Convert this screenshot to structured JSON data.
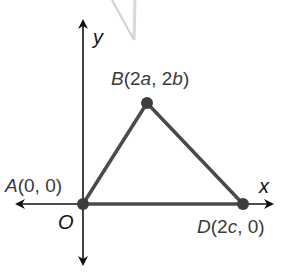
{
  "figure": {
    "type": "coordinate-plane-triangle",
    "axes": {
      "x_label": "x",
      "y_label": "y",
      "origin_label": "O"
    },
    "points": [
      {
        "id": "A",
        "name": "A",
        "coords": "(0, 0)",
        "x_expr": "0",
        "y_expr": "0"
      },
      {
        "id": "B",
        "name": "B",
        "coords": "(2a, 2b)",
        "x_expr": "2a",
        "y_expr": "2b"
      },
      {
        "id": "D",
        "name": "D",
        "coords": "(2c, 0)",
        "x_expr": "2c",
        "y_expr": "0"
      }
    ],
    "labels": {
      "A": {
        "letter": "A",
        "open": "(",
        "x": "0",
        "sep": ", ",
        "y": "0",
        "close": ")"
      },
      "B": {
        "letter": "B",
        "open": "(2",
        "xvar": "a",
        "sep": ", 2",
        "yvar": "b",
        "close": ")"
      },
      "D": {
        "letter": "D",
        "open": "(2",
        "xvar": "c",
        "sep": ", 0",
        "close": ")"
      }
    },
    "segments": [
      "AB",
      "BD",
      "AD"
    ],
    "colors": {
      "triangle": "#4a4a4a",
      "axes": "#111111",
      "points": "#3d3d3d",
      "artifact": "#c8c8c8"
    }
  }
}
